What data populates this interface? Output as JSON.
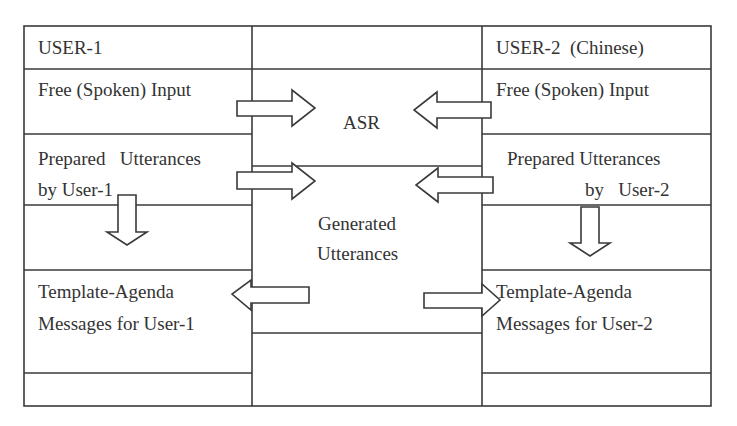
{
  "diagram": {
    "user1": {
      "header": "USER-1",
      "free_input": "Free (Spoken) Input",
      "prepared_line1": "Prepared   Utterances",
      "prepared_line2": "by User-1",
      "template_line1": "Template-Agenda",
      "template_line2": "Messages for User-1"
    },
    "user2": {
      "header": "USER-2  (Chinese)",
      "free_input": "Free (Spoken) Input",
      "prepared_line1": "Prepared Utterances",
      "prepared_line2": "by   User-2",
      "template_line1": "Template-Agenda",
      "template_line2": "Messages for User-2"
    },
    "center": {
      "asr": "ASR",
      "generated_line1": "Generated",
      "generated_line2": "Utterances"
    },
    "arrows": [
      {
        "name": "user1-free-to-asr",
        "direction": "right"
      },
      {
        "name": "user2-free-to-asr",
        "direction": "left"
      },
      {
        "name": "user1-prepared-to-generated",
        "direction": "right"
      },
      {
        "name": "user2-prepared-to-generated",
        "direction": "left"
      },
      {
        "name": "user1-prepared-to-template",
        "direction": "down"
      },
      {
        "name": "user2-prepared-to-template",
        "direction": "down"
      },
      {
        "name": "generated-to-user1-template",
        "direction": "left"
      },
      {
        "name": "generated-to-user2-template",
        "direction": "right"
      }
    ],
    "line_color": "#3a3a3a"
  }
}
